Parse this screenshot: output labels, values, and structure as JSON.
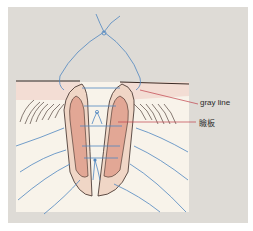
{
  "diagram": {
    "labels": [
      {
        "id": "gray-line",
        "text": "gray line"
      },
      {
        "id": "tarsus",
        "text": "瞼板"
      }
    ],
    "colors": {
      "background_panel": "#dedbd6",
      "skin": "#f8f3ea",
      "lid_margin": "#f3ddd4",
      "tarsus": "#e2a795",
      "lid_outline": "#f0d6c6",
      "suture": "#4f86c0",
      "leader_line": "#c0404a",
      "outline": "#3a2a24"
    }
  }
}
